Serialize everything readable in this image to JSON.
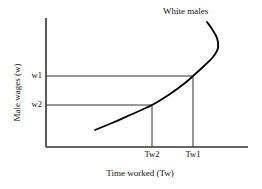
{
  "chart_data": {
    "type": "line",
    "title": "",
    "subtitle": "",
    "xlabel": "Time worked (Tw)",
    "ylabel": "Male wages (w)",
    "grid": false,
    "legend_position": "inline-annotation",
    "annotations": [
      {
        "text": "White males",
        "x_px": 163,
        "y_px": 7,
        "describes": "backward-bending labor supply curve"
      }
    ],
    "x_ticks": [
      {
        "label": "Tw2",
        "x_px": 152
      },
      {
        "label": "Tw1",
        "x_px": 193
      }
    ],
    "y_ticks": [
      {
        "label": "w1",
        "y_px": 76
      },
      {
        "label": "w2",
        "y_px": 105
      }
    ],
    "axes": {
      "origin_px": {
        "x": 46,
        "y": 147
      },
      "x_axis_end_px": {
        "x": 248,
        "y": 147
      },
      "y_axis_top_px": {
        "x": 46,
        "y": 18
      },
      "x_range_labels": [
        "0",
        "Tw2",
        "Tw1"
      ],
      "y_range_labels": [
        "0",
        "w2",
        "w1"
      ]
    },
    "series": [
      {
        "name": "White males",
        "shape": "backward-bending",
        "stroke_color": "#000000",
        "stroke_width": 1.8,
        "points_px": [
          {
            "x": 95,
            "y": 130
          },
          {
            "x": 112,
            "y": 123
          },
          {
            "x": 130,
            "y": 115
          },
          {
            "x": 152,
            "y": 105
          },
          {
            "x": 170,
            "y": 94
          },
          {
            "x": 185,
            "y": 83
          },
          {
            "x": 193,
            "y": 76
          },
          {
            "x": 204,
            "y": 66
          },
          {
            "x": 213,
            "y": 57
          },
          {
            "x": 218,
            "y": 48
          },
          {
            "x": 217,
            "y": 38
          },
          {
            "x": 212,
            "y": 29
          },
          {
            "x": 207,
            "y": 22
          }
        ]
      }
    ],
    "guide_lines": [
      {
        "name": "w1-horizontal",
        "from_px": {
          "x": 46,
          "y": 76
        },
        "to_px": {
          "x": 193,
          "y": 76
        }
      },
      {
        "name": "w2-horizontal",
        "from_px": {
          "x": 46,
          "y": 105
        },
        "to_px": {
          "x": 152,
          "y": 105
        }
      },
      {
        "name": "Tw1-vertical",
        "from_px": {
          "x": 193,
          "y": 76
        },
        "to_px": {
          "x": 193,
          "y": 147
        }
      },
      {
        "name": "Tw2-vertical",
        "from_px": {
          "x": 152,
          "y": 105
        },
        "to_px": {
          "x": 152,
          "y": 147
        }
      }
    ],
    "colors": {
      "curve": "#000000",
      "axis": "#333333",
      "guide": "#333333",
      "text": "#111111",
      "background": "#ffffff"
    }
  }
}
